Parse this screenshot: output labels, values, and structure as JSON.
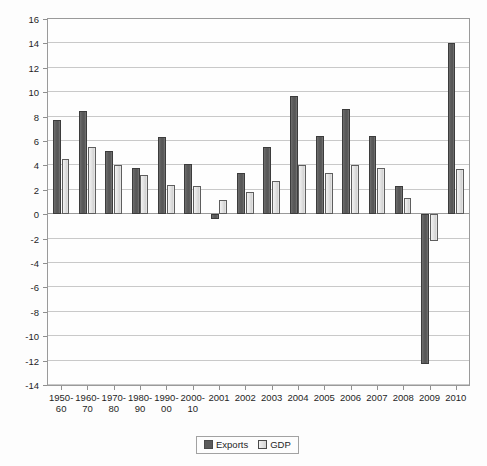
{
  "chart_data": {
    "type": "bar",
    "title": "",
    "xlabel": "",
    "ylabel": "",
    "ylim": [
      -14,
      16
    ],
    "ytick_step": 2,
    "grid": true,
    "legend_position": "bottom",
    "categories": [
      "1950-\n60",
      "1960-\n70",
      "1970-\n80",
      "1980-\n90",
      "1990-\n00",
      "2000-\n10",
      "2001",
      "2002",
      "2003",
      "2004",
      "2005",
      "2006",
      "2007",
      "2008",
      "2009",
      "2010"
    ],
    "category_lines": [
      [
        "1950-",
        "60"
      ],
      [
        "1960-",
        "70"
      ],
      [
        "1970-",
        "80"
      ],
      [
        "1980-",
        "90"
      ],
      [
        "1990-",
        "00"
      ],
      [
        "2000-",
        "10"
      ],
      [
        "2001",
        ""
      ],
      [
        "2002",
        ""
      ],
      [
        "2003",
        ""
      ],
      [
        "2004",
        ""
      ],
      [
        "2005",
        ""
      ],
      [
        "2006",
        ""
      ],
      [
        "2007",
        ""
      ],
      [
        "2008",
        ""
      ],
      [
        "2009",
        ""
      ],
      [
        "2010",
        ""
      ]
    ],
    "series": [
      {
        "name": "Exports",
        "color": "#5b5b5b",
        "values": [
          7.7,
          8.5,
          5.2,
          3.8,
          6.3,
          4.1,
          -0.4,
          3.4,
          5.5,
          9.7,
          6.4,
          8.6,
          6.4,
          2.3,
          -12.3,
          14.0
        ]
      },
      {
        "name": "GDP",
        "color": "#e0e0e0",
        "values": [
          4.5,
          5.5,
          4.0,
          3.2,
          2.4,
          2.3,
          1.2,
          1.8,
          2.7,
          4.0,
          3.4,
          4.0,
          3.8,
          1.3,
          -2.2,
          3.7
        ]
      }
    ],
    "ytick_labels": [
      "16",
      "14",
      "12",
      "10",
      "8",
      "6",
      "4",
      "2",
      "0",
      "-2",
      "-4",
      "-6",
      "-8",
      "-10",
      "-12",
      "-14"
    ],
    "ytick_values": [
      16,
      14,
      12,
      10,
      8,
      6,
      4,
      2,
      0,
      -2,
      -4,
      -6,
      -8,
      -10,
      -12,
      -14
    ]
  },
  "legend": {
    "items": [
      {
        "label": "Exports"
      },
      {
        "label": "GDP"
      }
    ]
  }
}
